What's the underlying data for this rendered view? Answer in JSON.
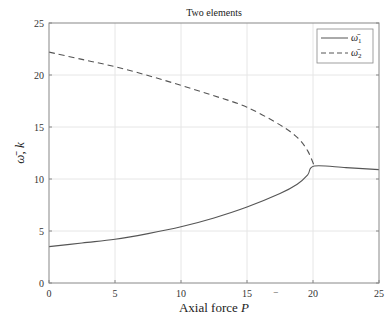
{
  "chart_data": {
    "type": "line",
    "title": "Two elements",
    "xlabel": "Axial force P̄",
    "ylabel": "ω̄ k",
    "xlim": [
      0,
      25
    ],
    "ylim": [
      0,
      25
    ],
    "xticks": [
      0,
      5,
      10,
      15,
      20,
      25
    ],
    "yticks": [
      0,
      5,
      10,
      15,
      20,
      25
    ],
    "grid": true,
    "legend_position": "upper right",
    "series": [
      {
        "name": "ω̄₁",
        "style": "solid",
        "color": "#555555",
        "x": [
          0,
          2.5,
          5,
          7.5,
          10,
          12.5,
          15,
          17.5,
          18.8,
          19.6,
          20.1,
          22.5,
          25
        ],
        "y": [
          3.5,
          3.85,
          4.2,
          4.75,
          5.4,
          6.25,
          7.3,
          8.6,
          9.5,
          10.4,
          11.25,
          11.1,
          10.9
        ]
      },
      {
        "name": "ω̄₂",
        "style": "dashed",
        "color": "#555555",
        "x": [
          0,
          2.5,
          5,
          7.5,
          10,
          12.5,
          15,
          17.5,
          18.8,
          19.6,
          20.1
        ],
        "y": [
          22.2,
          21.5,
          20.8,
          19.95,
          19.0,
          18.0,
          16.9,
          15.2,
          14.0,
          12.7,
          11.25
        ]
      }
    ]
  },
  "labels": {
    "title": "Two elements",
    "xlabel": "Axial force ",
    "xlabel_var": "P",
    "ylabel": "ω̄, k",
    "legend": [
      "ω̄",
      "ω̄"
    ],
    "legend_sub": [
      "1",
      "2"
    ]
  }
}
